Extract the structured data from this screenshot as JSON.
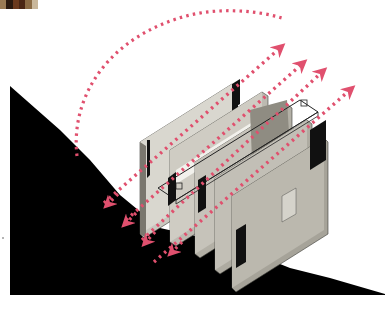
{
  "diagram": {
    "title": "",
    "type": "architectural axonometric section diagram",
    "colors": {
      "background": "#ffffff",
      "terrain": "#000000",
      "arrow": "#e0506e",
      "wall_light": "#d6d4cc",
      "wall_mid": "#a9a69c",
      "wall_dark": "#6f6c64",
      "glass_dark": "#111111"
    },
    "swatch_strip": [
      "#9a7b55",
      "#2b1a10",
      "#6b3a1e",
      "#4a2614",
      "#8a6a44",
      "#c9b79b"
    ],
    "elements": [
      {
        "id": "terrain",
        "label": "hillside terrain",
        "shape": "black sloping polygon"
      },
      {
        "id": "building",
        "label": "building slabs",
        "count": 5
      },
      {
        "id": "arc-arrow",
        "label": "curved dotted arrow over building"
      },
      {
        "id": "up-arrows",
        "label": "diagonal dotted arrows up-right",
        "count": 4
      },
      {
        "id": "down-arrows",
        "label": "dotted arrows down-left into slope",
        "count": 4
      }
    ]
  }
}
